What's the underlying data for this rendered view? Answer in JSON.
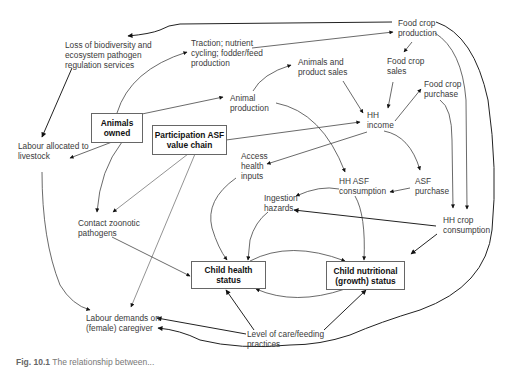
{
  "diagram": {
    "type": "causal pathway diagram",
    "boxed_nodes": {
      "animals_owned": "Animals\nowned",
      "participation_asf": "Participation ASF\nvalue chain",
      "child_health": "Child health status",
      "child_nutritional": "Child nutritional\n(growth) status"
    },
    "nodes": {
      "loss_biodiversity": "Loss of biodiversity and\necosystem pathogen\nregulation services",
      "traction": "Traction; nutrient\ncycling; fodder/feed\nproduction",
      "food_crop_production": "Food crop\nproduction",
      "food_crop_sales": "Food crop\nsales",
      "animals_product_sales": "Animals and\nproduct sales",
      "food_crop_purchase": "Food crop\npurchase",
      "animal_production": "Animal\nproduction",
      "hh_income": "HH\nincome",
      "labour_livestock": "Labour allocated to\nlivestock",
      "access_health": "Access\nhealth\ninputs",
      "hh_asf_consumption": "HH ASF\nconsumption",
      "asf_purchase": "ASF\npurchase",
      "ingestion_hazards": "Ingestion\nhazards",
      "hh_crop_consumption": "HH crop\nconsumption",
      "contact_zoonotic": "Contact zoonotic\npathogens",
      "labour_caregiver": "Labour demands on\n(female) caregiver",
      "level_care": "Level of care/feeding\npractices"
    },
    "edges": [
      [
        "food_crop_production",
        "loss_biodiversity"
      ],
      [
        "traction",
        "food_crop_production"
      ],
      [
        "food_crop_production",
        "food_crop_sales"
      ],
      [
        "food_crop_production",
        "hh_crop_consumption"
      ],
      [
        "food_crop_production",
        "labour_caregiver"
      ],
      [
        "animals_owned",
        "traction"
      ],
      [
        "animals_owned",
        "animal_production"
      ],
      [
        "animals_owned",
        "labour_livestock"
      ],
      [
        "animals_owned",
        "contact_zoonotic"
      ],
      [
        "loss_biodiversity",
        "labour_livestock"
      ],
      [
        "animal_production",
        "animals_product_sales"
      ],
      [
        "animal_production",
        "hh_asf_consumption"
      ],
      [
        "animals_product_sales",
        "hh_income"
      ],
      [
        "food_crop_sales",
        "hh_income"
      ],
      [
        "hh_income",
        "food_crop_purchase"
      ],
      [
        "hh_income",
        "access_health"
      ],
      [
        "hh_income",
        "asf_purchase"
      ],
      [
        "participation_asf",
        "hh_income"
      ],
      [
        "participation_asf",
        "contact_zoonotic"
      ],
      [
        "participation_asf",
        "labour_caregiver"
      ],
      [
        "food_crop_purchase",
        "hh_crop_consumption"
      ],
      [
        "asf_purchase",
        "hh_asf_consumption"
      ],
      [
        "hh_asf_consumption",
        "ingestion_hazards"
      ],
      [
        "hh_asf_consumption",
        "child_nutritional"
      ],
      [
        "hh_crop_consumption",
        "ingestion_hazards"
      ],
      [
        "hh_crop_consumption",
        "child_nutritional"
      ],
      [
        "access_health",
        "child_health"
      ],
      [
        "ingestion_hazards",
        "child_health"
      ],
      [
        "contact_zoonotic",
        "child_health"
      ],
      [
        "child_health",
        "child_nutritional"
      ],
      [
        "child_nutritional",
        "child_health"
      ],
      [
        "labour_livestock",
        "labour_caregiver"
      ],
      [
        "level_care",
        "labour_caregiver"
      ],
      [
        "level_care",
        "child_health"
      ],
      [
        "level_care",
        "child_nutritional"
      ]
    ]
  },
  "caption": {
    "label": "Fig. 10.1",
    "text": "The relationship between..."
  }
}
